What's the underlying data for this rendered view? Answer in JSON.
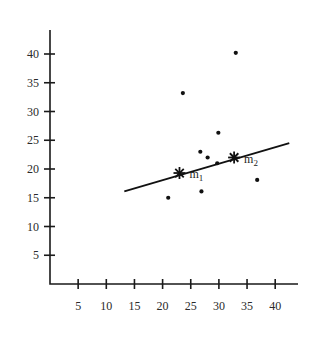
{
  "chart_data": {
    "type": "scatter",
    "title": "",
    "xlabel": "",
    "ylabel": "",
    "xlim": [
      0,
      44
    ],
    "ylim": [
      0,
      44
    ],
    "grid": false,
    "legend": null,
    "x_ticks": [
      5,
      10,
      15,
      20,
      25,
      30,
      35,
      40
    ],
    "y_ticks": [
      5,
      10,
      15,
      20,
      25,
      30,
      35,
      40
    ],
    "x_tick_labels": [
      "5",
      "10",
      "15",
      "20",
      "25",
      "30",
      "35",
      "40"
    ],
    "y_tick_labels": [
      "5",
      "10",
      "15",
      "20",
      "25",
      "30",
      "35",
      "40"
    ],
    "series": [
      {
        "name": "points",
        "marker": "dot",
        "points": [
          {
            "x": 33.0,
            "y": 40.2
          },
          {
            "x": 23.6,
            "y": 33.2
          },
          {
            "x": 29.9,
            "y": 26.3
          },
          {
            "x": 26.7,
            "y": 23.0
          },
          {
            "x": 28.0,
            "y": 22.0
          },
          {
            "x": 29.7,
            "y": 21.0
          },
          {
            "x": 36.8,
            "y": 18.1
          },
          {
            "x": 26.9,
            "y": 16.1
          },
          {
            "x": 21.0,
            "y": 15.0
          }
        ]
      },
      {
        "name": "means",
        "marker": "asterisk",
        "points": [
          {
            "x": 23.0,
            "y": 19.3,
            "label": "m",
            "sub": "1"
          },
          {
            "x": 32.7,
            "y": 22.0,
            "label": "m",
            "sub": "2"
          }
        ]
      }
    ],
    "lines": [
      {
        "name": "fit-line",
        "x1": 13.2,
        "y1": 16.1,
        "x2": 42.5,
        "y2": 24.5
      }
    ]
  },
  "layout": {
    "origin_px": [
      50,
      284
    ],
    "x_px_per_unit": 5.63,
    "y_px_per_unit": 5.75,
    "x_axis_end_px": 298,
    "y_axis_top_px": 30
  }
}
